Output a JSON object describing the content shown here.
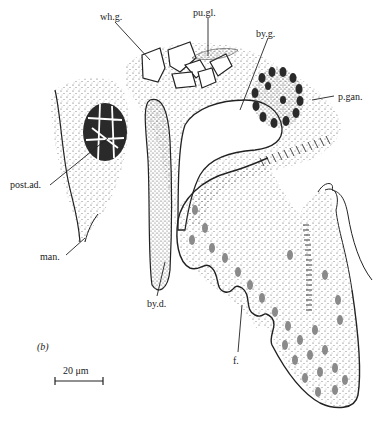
{
  "figure": {
    "panel_label": "(b)",
    "scale_bar": {
      "label": "20 μm",
      "length_px": 48
    },
    "colors": {
      "ink": "#222222",
      "stipple": "#555555",
      "dark_cells": "#2a2a2a",
      "nuclei": "#8a8a8a",
      "background": "#ffffff"
    }
  },
  "labels": [
    {
      "id": "wh_g",
      "text": "wh.g.",
      "x": 100,
      "y": 12
    },
    {
      "id": "pu_gl",
      "text": "pu.gl.",
      "x": 193,
      "y": 8
    },
    {
      "id": "by_g",
      "text": "by.g.",
      "x": 256,
      "y": 29
    },
    {
      "id": "p_gan",
      "text": "p.gan.",
      "x": 338,
      "y": 96
    },
    {
      "id": "post_ad",
      "text": "post.ad.",
      "x": 10,
      "y": 184
    },
    {
      "id": "man",
      "text": "man.",
      "x": 40,
      "y": 251
    },
    {
      "id": "by_d",
      "text": "by.d.",
      "x": 147,
      "y": 299
    },
    {
      "id": "f",
      "text": "f.",
      "x": 233,
      "y": 356
    }
  ]
}
